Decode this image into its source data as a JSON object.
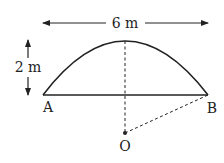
{
  "diagram": {
    "width_label": "6 m",
    "height_label": "2 m",
    "point_a": "A",
    "point_b": "B",
    "point_o": "O",
    "colors": {
      "stroke": "#222222",
      "background": "#ffffff"
    }
  }
}
